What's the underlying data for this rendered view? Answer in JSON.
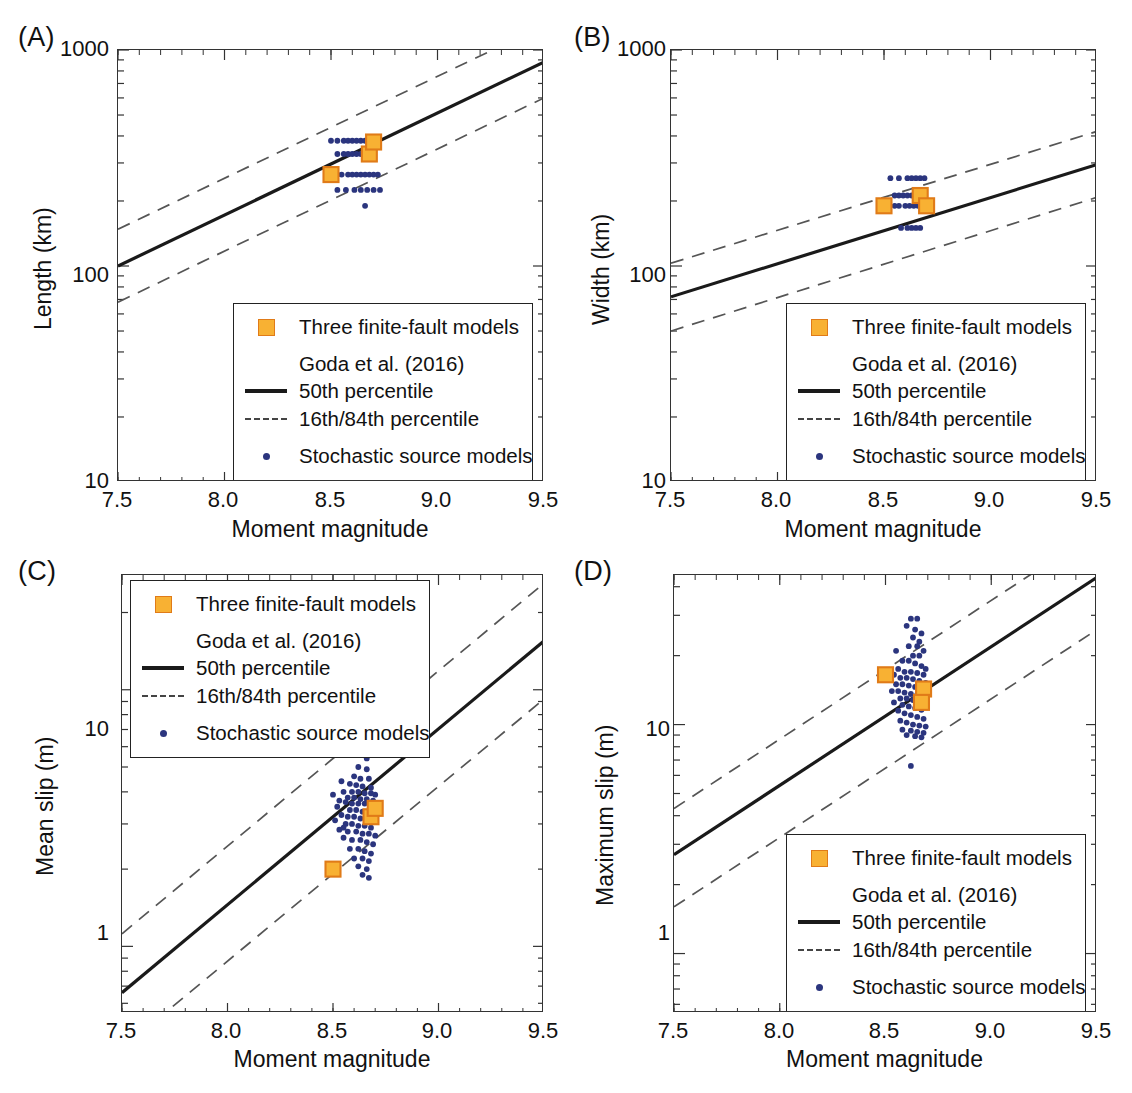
{
  "figure": {
    "background": "#ffffff",
    "accent_orange": "#F8B133",
    "accent_orange_edge": "#E07B18",
    "accent_blue": "#2B357E",
    "line_color": "#1a1a1a",
    "caption": ""
  },
  "legend": {
    "finite_fault_label": "Three finite-fault models",
    "source_label": "Goda et al. (2016)",
    "median_label": "50th percentile",
    "percentile_label": "16th/84th percentile",
    "stochastic_label": "Stochastic source models",
    "icons": {
      "finite_fault": "orange-square-marker",
      "median": "solid-line-swatch",
      "percentile": "dashed-line-swatch",
      "stochastic": "blue-dot-marker"
    }
  },
  "chart_data": [
    {
      "id": "A",
      "panel_label": "(A)",
      "type": "scatter",
      "title": "",
      "xlabel": "Moment magnitude",
      "ylabel": "Length (km)",
      "xlim": [
        7.5,
        9.5
      ],
      "ylim": [
        10,
        1000
      ],
      "yscale": "log",
      "xticks": [
        7.5,
        8.0,
        8.5,
        9.0,
        9.5
      ],
      "xticklabels": [
        "7.5",
        "8.0",
        "8.5",
        "9.0",
        "9.5"
      ],
      "yticks": [
        10,
        100,
        1000
      ],
      "yticklabels": [
        "10",
        "100",
        "1000"
      ],
      "grid": false,
      "legend_position": "lower-right",
      "trend_lines": [
        {
          "name": "50th percentile",
          "style": "solid",
          "points": [
            [
              7.5,
              100
            ],
            [
              9.5,
              880
            ]
          ]
        },
        {
          "name": "84th percentile",
          "style": "dashed",
          "points": [
            [
              7.5,
              148
            ],
            [
              9.5,
              1300
            ]
          ]
        },
        {
          "name": "16th percentile",
          "style": "dashed",
          "points": [
            [
              7.5,
              68
            ],
            [
              9.5,
              600
            ]
          ]
        }
      ],
      "finite_fault_models": [
        {
          "x": 8.5,
          "y": 265
        },
        {
          "x": 8.68,
          "y": 330
        },
        {
          "x": 8.7,
          "y": 375
        }
      ],
      "stochastic_points": [
        [
          8.53,
          380
        ],
        [
          8.56,
          380
        ],
        [
          8.58,
          380
        ],
        [
          8.6,
          380
        ],
        [
          8.62,
          380
        ],
        [
          8.64,
          380
        ],
        [
          8.66,
          380
        ],
        [
          8.68,
          380
        ],
        [
          8.56,
          330
        ],
        [
          8.58,
          330
        ],
        [
          8.6,
          330
        ],
        [
          8.62,
          330
        ],
        [
          8.64,
          330
        ],
        [
          8.66,
          330
        ],
        [
          8.68,
          330
        ],
        [
          8.7,
          330
        ],
        [
          8.5,
          380
        ],
        [
          8.53,
          330
        ],
        [
          8.58,
          265
        ],
        [
          8.6,
          265
        ],
        [
          8.62,
          265
        ],
        [
          8.64,
          265
        ],
        [
          8.66,
          265
        ],
        [
          8.68,
          265
        ],
        [
          8.7,
          265
        ],
        [
          8.72,
          265
        ],
        [
          8.53,
          265
        ],
        [
          8.55,
          265
        ],
        [
          8.53,
          225
        ],
        [
          8.57,
          225
        ],
        [
          8.61,
          225
        ],
        [
          8.64,
          225
        ],
        [
          8.67,
          225
        ],
        [
          8.7,
          225
        ],
        [
          8.73,
          225
        ],
        [
          8.66,
          190
        ]
      ]
    },
    {
      "id": "B",
      "panel_label": "(B)",
      "type": "scatter",
      "title": "",
      "xlabel": "Moment magnitude",
      "ylabel": "Width (km)",
      "xlim": [
        7.5,
        9.5
      ],
      "ylim": [
        10,
        1000
      ],
      "yscale": "log",
      "xticks": [
        7.5,
        8.0,
        8.5,
        9.0,
        9.5
      ],
      "xticklabels": [
        "7.5",
        "8.0",
        "8.5",
        "9.0",
        "9.5"
      ],
      "yticks": [
        10,
        100,
        1000
      ],
      "yticklabels": [
        "10",
        "100",
        "1000"
      ],
      "grid": false,
      "legend_position": "lower-right",
      "trend_lines": [
        {
          "name": "50th percentile",
          "style": "solid",
          "points": [
            [
              7.5,
              72
            ],
            [
              9.5,
              295
            ]
          ]
        },
        {
          "name": "84th percentile",
          "style": "dashed",
          "points": [
            [
              7.5,
              103
            ],
            [
              9.5,
              420
            ]
          ]
        },
        {
          "name": "16th percentile",
          "style": "dashed",
          "points": [
            [
              7.5,
              50
            ],
            [
              9.5,
              208
            ]
          ]
        }
      ],
      "finite_fault_models": [
        {
          "x": 8.5,
          "y": 190
        },
        {
          "x": 8.67,
          "y": 212
        },
        {
          "x": 8.7,
          "y": 190
        }
      ],
      "stochastic_points": [
        [
          8.57,
          255
        ],
        [
          8.61,
          255
        ],
        [
          8.63,
          255
        ],
        [
          8.65,
          255
        ],
        [
          8.67,
          255
        ],
        [
          8.69,
          255
        ],
        [
          8.53,
          255
        ],
        [
          8.55,
          212
        ],
        [
          8.57,
          212
        ],
        [
          8.59,
          212
        ],
        [
          8.61,
          212
        ],
        [
          8.63,
          212
        ],
        [
          8.65,
          212
        ],
        [
          8.67,
          212
        ],
        [
          8.69,
          212
        ],
        [
          8.52,
          190
        ],
        [
          8.55,
          190
        ],
        [
          8.57,
          190
        ],
        [
          8.6,
          190
        ],
        [
          8.62,
          190
        ],
        [
          8.64,
          190
        ],
        [
          8.66,
          190
        ],
        [
          8.68,
          190
        ],
        [
          8.58,
          150
        ],
        [
          8.61,
          150
        ],
        [
          8.63,
          150
        ],
        [
          8.65,
          150
        ],
        [
          8.67,
          150
        ]
      ]
    },
    {
      "id": "C",
      "panel_label": "(C)",
      "type": "scatter",
      "title": "",
      "xlabel": "Moment magnitude",
      "ylabel": "Mean slip (m)",
      "xlim": [
        7.5,
        9.5
      ],
      "ylim": [
        0.55,
        28
      ],
      "yscale": "log",
      "xticks": [
        7.5,
        8.0,
        8.5,
        9.0,
        9.5
      ],
      "xticklabels": [
        "7.5",
        "8.0",
        "8.5",
        "9.0",
        "9.5"
      ],
      "yticks": [
        1,
        10
      ],
      "yticklabels": [
        "1",
        "10"
      ],
      "grid": false,
      "legend_position": "upper-left",
      "trend_lines": [
        {
          "name": "50th percentile",
          "style": "solid",
          "points": [
            [
              7.5,
              0.66
            ],
            [
              9.5,
              15.5
            ]
          ]
        },
        {
          "name": "84th percentile",
          "style": "dashed",
          "points": [
            [
              7.5,
              1.12
            ],
            [
              9.5,
              26.0
            ]
          ]
        },
        {
          "name": "16th percentile",
          "style": "dashed",
          "points": [
            [
              7.5,
              0.4
            ],
            [
              9.5,
              9.2
            ]
          ]
        }
      ],
      "finite_fault_models": [
        {
          "x": 8.5,
          "y": 2.0
        },
        {
          "x": 8.68,
          "y": 3.2
        },
        {
          "x": 8.7,
          "y": 3.45
        }
      ],
      "stochastic_points": [
        [
          8.63,
          6.6
        ],
        [
          8.65,
          6.5
        ],
        [
          8.67,
          6.3
        ],
        [
          8.64,
          5.7
        ],
        [
          8.66,
          5.4
        ],
        [
          8.62,
          5.0
        ],
        [
          8.66,
          4.9
        ],
        [
          8.6,
          4.6
        ],
        [
          8.63,
          4.5
        ],
        [
          8.67,
          4.5
        ],
        [
          8.58,
          4.3
        ],
        [
          8.61,
          4.25
        ],
        [
          8.64,
          4.2
        ],
        [
          8.68,
          4.15
        ],
        [
          8.55,
          4.0
        ],
        [
          8.59,
          4.0
        ],
        [
          8.62,
          4.0
        ],
        [
          8.65,
          3.95
        ],
        [
          8.68,
          3.95
        ],
        [
          8.7,
          3.9
        ],
        [
          8.57,
          3.8
        ],
        [
          8.6,
          3.8
        ],
        [
          8.63,
          3.75
        ],
        [
          8.66,
          3.75
        ],
        [
          8.69,
          3.7
        ],
        [
          8.53,
          3.7
        ],
        [
          8.56,
          3.65
        ],
        [
          8.59,
          3.6
        ],
        [
          8.62,
          3.6
        ],
        [
          8.65,
          3.6
        ],
        [
          8.68,
          3.55
        ],
        [
          8.71,
          3.5
        ],
        [
          8.58,
          3.4
        ],
        [
          8.61,
          3.4
        ],
        [
          8.64,
          3.35
        ],
        [
          8.67,
          3.35
        ],
        [
          8.7,
          3.3
        ],
        [
          8.54,
          3.25
        ],
        [
          8.57,
          3.2
        ],
        [
          8.6,
          3.2
        ],
        [
          8.63,
          3.15
        ],
        [
          8.66,
          3.15
        ],
        [
          8.69,
          3.1
        ],
        [
          8.56,
          3.0
        ],
        [
          8.59,
          3.0
        ],
        [
          8.62,
          2.95
        ],
        [
          8.65,
          2.95
        ],
        [
          8.68,
          2.9
        ],
        [
          8.53,
          2.85
        ],
        [
          8.57,
          2.8
        ],
        [
          8.61,
          2.8
        ],
        [
          8.64,
          2.75
        ],
        [
          8.67,
          2.75
        ],
        [
          8.7,
          2.7
        ],
        [
          8.55,
          2.65
        ],
        [
          8.59,
          2.6
        ],
        [
          8.63,
          2.6
        ],
        [
          8.66,
          2.55
        ],
        [
          8.69,
          2.5
        ],
        [
          8.58,
          2.4
        ],
        [
          8.62,
          2.4
        ],
        [
          8.65,
          2.35
        ],
        [
          8.68,
          2.3
        ],
        [
          8.6,
          2.2
        ],
        [
          8.64,
          2.2
        ],
        [
          8.67,
          2.15
        ],
        [
          8.62,
          2.05
        ],
        [
          8.66,
          2.0
        ],
        [
          8.64,
          1.9
        ],
        [
          8.67,
          1.85
        ],
        [
          8.52,
          3.5
        ],
        [
          8.5,
          3.9
        ],
        [
          8.54,
          4.4
        ],
        [
          8.51,
          3.1
        ],
        [
          8.55,
          2.9
        ]
      ]
    },
    {
      "id": "D",
      "panel_label": "(D)",
      "type": "scatter",
      "title": "",
      "xlabel": "Moment magnitude",
      "ylabel": "Maximum slip (m)",
      "xlim": [
        7.5,
        9.5
      ],
      "ylim": [
        0.55,
        45
      ],
      "yscale": "log",
      "xticks": [
        7.5,
        8.0,
        8.5,
        9.0,
        9.5
      ],
      "xticklabels": [
        "7.5",
        "8.0",
        "8.5",
        "9.0",
        "9.5"
      ],
      "yticks": [
        1,
        10
      ],
      "yticklabels": [
        "1",
        "10"
      ],
      "grid": false,
      "legend_position": "lower-right",
      "trend_lines": [
        {
          "name": "50th percentile",
          "style": "solid",
          "points": [
            [
              7.5,
              2.7
            ],
            [
              9.5,
              44.0
            ]
          ]
        },
        {
          "name": "84th percentile",
          "style": "dashed",
          "points": [
            [
              7.5,
              4.3
            ],
            [
              9.5,
              70.0
            ]
          ]
        },
        {
          "name": "16th percentile",
          "style": "dashed",
          "points": [
            [
              7.5,
              1.6
            ],
            [
              9.5,
              26.0
            ]
          ]
        }
      ],
      "finite_fault_models": [
        {
          "x": 8.5,
          "y": 16.5
        },
        {
          "x": 8.68,
          "y": 14.3
        },
        {
          "x": 8.67,
          "y": 12.5
        }
      ],
      "stochastic_points": [
        [
          8.62,
          29
        ],
        [
          8.65,
          29
        ],
        [
          8.6,
          27
        ],
        [
          8.64,
          26
        ],
        [
          8.67,
          25
        ],
        [
          8.63,
          24
        ],
        [
          8.66,
          23
        ],
        [
          8.61,
          22
        ],
        [
          8.65,
          22
        ],
        [
          8.68,
          21
        ],
        [
          8.55,
          21
        ],
        [
          8.63,
          20
        ],
        [
          8.66,
          20
        ],
        [
          8.58,
          19
        ],
        [
          8.61,
          19
        ],
        [
          8.64,
          18.5
        ],
        [
          8.67,
          18
        ],
        [
          8.69,
          17.5
        ],
        [
          8.56,
          17.5
        ],
        [
          8.59,
          17
        ],
        [
          8.62,
          17
        ],
        [
          8.65,
          16.8
        ],
        [
          8.68,
          16.5
        ],
        [
          8.54,
          16.5
        ],
        [
          8.57,
          16
        ],
        [
          8.6,
          16
        ],
        [
          8.63,
          15.8
        ],
        [
          8.66,
          15.5
        ],
        [
          8.69,
          15.2
        ],
        [
          8.55,
          15
        ],
        [
          8.58,
          15
        ],
        [
          8.61,
          14.8
        ],
        [
          8.64,
          14.6
        ],
        [
          8.67,
          14.4
        ],
        [
          8.7,
          14.2
        ],
        [
          8.53,
          14
        ],
        [
          8.56,
          14
        ],
        [
          8.59,
          13.8
        ],
        [
          8.62,
          13.6
        ],
        [
          8.65,
          13.5
        ],
        [
          8.68,
          13.3
        ],
        [
          8.57,
          13
        ],
        [
          8.6,
          13
        ],
        [
          8.63,
          12.8
        ],
        [
          8.66,
          12.6
        ],
        [
          8.69,
          12.4
        ],
        [
          8.54,
          12.5
        ],
        [
          8.58,
          12.2
        ],
        [
          8.61,
          12
        ],
        [
          8.64,
          11.8
        ],
        [
          8.67,
          11.6
        ],
        [
          8.56,
          11.5
        ],
        [
          8.59,
          11.2
        ],
        [
          8.62,
          11
        ],
        [
          8.65,
          10.8
        ],
        [
          8.68,
          10.6
        ],
        [
          8.57,
          10.4
        ],
        [
          8.6,
          10.2
        ],
        [
          8.63,
          10
        ],
        [
          8.66,
          9.9
        ],
        [
          8.69,
          9.8
        ],
        [
          8.58,
          9.5
        ],
        [
          8.62,
          9.4
        ],
        [
          8.65,
          9.3
        ],
        [
          8.68,
          9.2
        ],
        [
          8.6,
          9.0
        ],
        [
          8.64,
          8.9
        ],
        [
          8.67,
          8.8
        ],
        [
          8.62,
          6.6
        ]
      ]
    }
  ]
}
